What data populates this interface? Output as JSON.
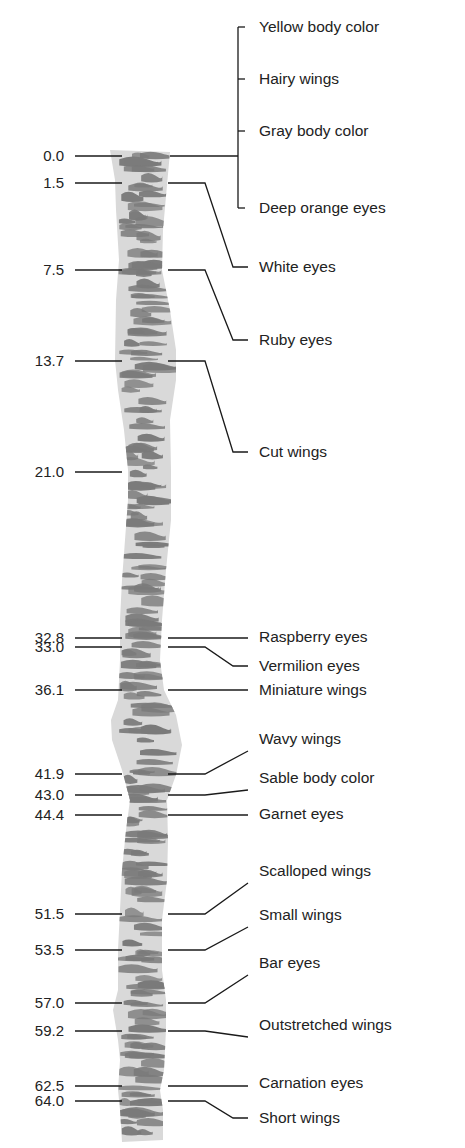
{
  "diagram": {
    "type": "genetic-linkage-map",
    "colors": {
      "chromosome_fill": "#d9d9d9",
      "band": "#7a7a7a",
      "line": "#1a1a1a",
      "text": "#222222"
    },
    "loci": [
      {
        "position": "0.0",
        "y": 156
      },
      {
        "position": "1.5",
        "y": 183
      },
      {
        "position": "7.5",
        "y": 270
      },
      {
        "position": "13.7",
        "y": 361
      },
      {
        "position": "21.0",
        "y": 472
      },
      {
        "position": "32.8",
        "y": 638
      },
      {
        "position": "33.0",
        "y": 647
      },
      {
        "position": "36.1",
        "y": 690
      },
      {
        "position": "41.9",
        "y": 774
      },
      {
        "position": "43.0",
        "y": 795
      },
      {
        "position": "44.4",
        "y": 815
      },
      {
        "position": "51.5",
        "y": 914
      },
      {
        "position": "53.5",
        "y": 950
      },
      {
        "position": "57.0",
        "y": 1003
      },
      {
        "position": "59.2",
        "y": 1031
      },
      {
        "position": "62.5",
        "y": 1086
      },
      {
        "position": "64.0",
        "y": 1101
      }
    ],
    "traits": [
      {
        "label": "Yellow body color",
        "y": 27,
        "locus": "0.0"
      },
      {
        "label": "Hairy wings",
        "y": 79,
        "locus": "0.0"
      },
      {
        "label": "Gray body color",
        "y": 131,
        "locus": "0.0"
      },
      {
        "label": "Deep orange eyes",
        "y": 208,
        "locus": "0.0"
      },
      {
        "label": "White eyes",
        "y": 267,
        "locus": "1.5"
      },
      {
        "label": "Ruby eyes",
        "y": 340,
        "locus": "7.5"
      },
      {
        "label": "Cut wings",
        "y": 452,
        "locus": "13.7"
      },
      {
        "label": "Raspberry eyes",
        "y": 637,
        "locus": "32.8"
      },
      {
        "label": "Vermilion eyes",
        "y": 666,
        "locus": "33.0"
      },
      {
        "label": "Miniature wings",
        "y": 690,
        "locus": "36.1"
      },
      {
        "label": "Wavy wings",
        "y": 739,
        "locus": "41.9"
      },
      {
        "label": "Sable body color",
        "y": 778,
        "locus": "43.0"
      },
      {
        "label": "Garnet eyes",
        "y": 814,
        "locus": "44.4"
      },
      {
        "label": "Scalloped wings",
        "y": 871,
        "locus": "51.5"
      },
      {
        "label": "Small wings",
        "y": 915,
        "locus": "53.5"
      },
      {
        "label": "Bar eyes",
        "y": 963,
        "locus": "57.0"
      },
      {
        "label": "Outstretched wings",
        "y": 1025,
        "locus": "59.2"
      },
      {
        "label": "Carnation eyes",
        "y": 1083,
        "locus": "62.5"
      },
      {
        "label": "Short wings",
        "y": 1118,
        "locus": "64.0"
      }
    ]
  }
}
